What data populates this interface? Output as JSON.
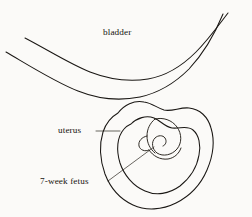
{
  "figure": {
    "kind": "anatomical-line-drawing",
    "style": "ink line art, scanned book page",
    "background_color": "#fbfaf8",
    "line_color": "#1a1714",
    "leader_color": "#2a251e",
    "width": 252,
    "height": 217
  },
  "labels": {
    "bladder": "bladder",
    "uterus": "uterus",
    "fetus": "7-week fetus"
  },
  "structures": [
    {
      "name": "bladder",
      "description": "Two long roughly parallel curved lines sweeping from the upper left edge down to a trough and up to the top right corner, forming the bladder wall."
    },
    {
      "name": "uterus",
      "description": "Rounded pear-shaped organ below the bladder, drawn as a double contour: an outer muscular wall and an inner cavity lining."
    },
    {
      "name": "7-week fetus",
      "description": "Small curled comma-shaped embryo with a limb bud, nestled inside the uterine cavity."
    }
  ],
  "leaders": [
    {
      "name": "uterus-leader",
      "description": "Short horizontal line from the uterus label to the outer uterine wall."
    },
    {
      "name": "fetus-leader",
      "description": "Long thin diagonal line from the 7-week fetus label up and right to the embryo."
    }
  ]
}
